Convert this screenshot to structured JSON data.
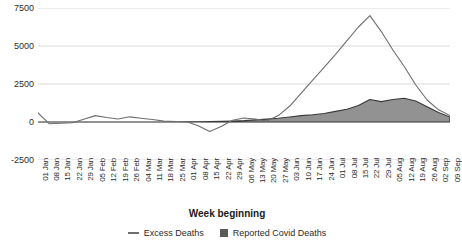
{
  "chart_data": {
    "type": "area",
    "title": "",
    "xlabel": "Week beginning",
    "ylabel": "",
    "ylim": [
      -2500,
      7500
    ],
    "yticks": [
      7500,
      5000,
      2500,
      0,
      -2500
    ],
    "ytick_labels": [
      "7500",
      "5000",
      "2500",
      "0",
      "-2500"
    ],
    "grid": true,
    "legend_position": "bottom",
    "categories": [
      "01 Jan",
      "08 Jan",
      "15 Jan",
      "22 Jan",
      "29 Jan",
      "05 Feb",
      "12 Feb",
      "19 Feb",
      "26 Feb",
      "04 Mar",
      "11 Mar",
      "18 Mar",
      "25 Mar",
      "01 Apr",
      "08 Apr",
      "15 Apr",
      "22 Apr",
      "29 Apr",
      "06 May",
      "13 May",
      "20 May",
      "27 May",
      "03 Jun",
      "10 Jun",
      "17 Jun",
      "24 Jun",
      "01 Jul",
      "08 Jul",
      "15 Jul",
      "22 Jul",
      "29 Jul",
      "05 Aug",
      "12 Aug",
      "19 Aug",
      "26 Aug",
      "02 Sep",
      "09 Sep"
    ],
    "series": [
      {
        "name": "Excess Deaths",
        "style": "line",
        "color": "#6e6e6e",
        "values": [
          600,
          -120,
          -80,
          -50,
          180,
          420,
          300,
          200,
          340,
          250,
          160,
          60,
          30,
          20,
          -250,
          -620,
          -300,
          120,
          260,
          200,
          60,
          420,
          1050,
          1900,
          2750,
          3600,
          4450,
          5350,
          6250,
          7000,
          5950,
          4750,
          3650,
          2450,
          1450,
          800,
          420
        ]
      },
      {
        "name": "Reported Covid Deaths",
        "style": "area",
        "color": "#808080",
        "values": [
          0,
          0,
          0,
          0,
          0,
          0,
          0,
          0,
          0,
          0,
          0,
          0,
          0,
          10,
          20,
          30,
          40,
          60,
          90,
          140,
          190,
          250,
          330,
          420,
          480,
          560,
          700,
          840,
          1080,
          1480,
          1340,
          1480,
          1560,
          1380,
          1000,
          620,
          330
        ]
      }
    ],
    "legend": [
      {
        "label": "Excess Deaths",
        "marker": "line-swatch"
      },
      {
        "label": "Reported Covid Deaths",
        "marker": "box-swatch"
      }
    ]
  }
}
